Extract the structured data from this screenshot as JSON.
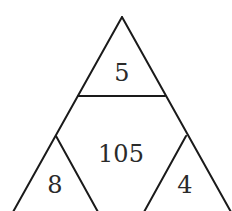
{
  "diagram": {
    "type": "number-triangle-puzzle",
    "cells": {
      "top": "5",
      "center": "105",
      "bottom_left": "8",
      "bottom_right": "4"
    },
    "colors": {
      "line": "#1a1a1a",
      "text": "#2a2a2a",
      "background": "#ffffff"
    }
  }
}
